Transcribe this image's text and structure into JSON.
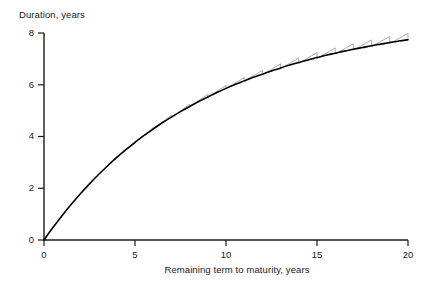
{
  "chart_data": {
    "type": "line",
    "title": "",
    "subtitle": "",
    "xlabel": "Remaining term to maturity, years",
    "ylabel": "Duration, years",
    "xlim": [
      0,
      20
    ],
    "ylim": [
      0,
      8
    ],
    "xticks": [
      0,
      5,
      10,
      15,
      20
    ],
    "yticks": [
      0,
      2,
      4,
      6,
      8
    ],
    "xtick_labels": [
      "0",
      "5",
      "10",
      "15",
      "20"
    ],
    "ytick_labels": [
      "0",
      "2",
      "4",
      "6",
      "8"
    ],
    "grid": false,
    "legend": null,
    "legend_position": "none",
    "annotations": [],
    "series": [
      {
        "name": "Duration (smooth envelope)",
        "type": "line",
        "color": "#000000",
        "linewidth": 1.6,
        "x": [
          0,
          0.25,
          0.5,
          0.75,
          1,
          1.5,
          2,
          2.5,
          3,
          3.5,
          4,
          4.5,
          5,
          5.5,
          6,
          6.5,
          7,
          7.5,
          8,
          8.5,
          9,
          9.5,
          10,
          10.5,
          11,
          11.5,
          12,
          12.5,
          13,
          13.5,
          14,
          14.5,
          15,
          15.5,
          16,
          16.5,
          17,
          17.5,
          18,
          18.5,
          19,
          19.5,
          20
        ],
        "values": [
          0,
          0.25,
          0.49,
          0.72,
          0.95,
          1.38,
          1.79,
          2.17,
          2.53,
          2.87,
          3.19,
          3.49,
          3.77,
          4.04,
          4.29,
          4.53,
          4.75,
          4.96,
          5.16,
          5.35,
          5.53,
          5.7,
          5.86,
          6.01,
          6.15,
          6.29,
          6.41,
          6.53,
          6.65,
          6.76,
          6.86,
          6.96,
          7.05,
          7.14,
          7.22,
          7.3,
          7.37,
          7.44,
          7.51,
          7.57,
          7.63,
          7.69,
          7.74
        ]
      },
      {
        "name": "Duration (coupon-cycle sawtooth)",
        "type": "line",
        "color": "#8a8a8a",
        "linewidth": 0.7,
        "description": "Sawtooth oscillation about the smooth curve; amplitude grows with maturity, one tooth per coupon period.",
        "teeth_period": 1.0,
        "teeth_start": 3.0,
        "amplitude_at_5": 0.04,
        "amplitude_at_10": 0.12,
        "amplitude_at_15": 0.2,
        "amplitude_at_20": 0.26
      }
    ]
  },
  "axes": {
    "y_title": "Duration, years",
    "x_title": "Remaining term to maturity, years"
  },
  "style": {
    "background": "#ffffff",
    "axis_color": "#1a1a1a",
    "curve_color": "#000000",
    "sawtooth_color": "#8a8a8a"
  }
}
